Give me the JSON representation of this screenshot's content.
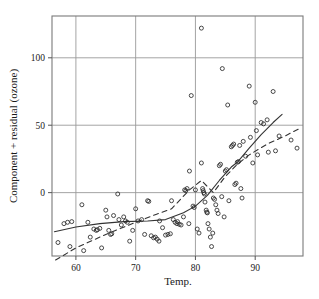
{
  "chart_data": {
    "type": "scatter",
    "title": "",
    "xlabel": "Temp.",
    "ylabel": "Component + residual (ozone)",
    "xlim": [
      56.0,
      98.0
    ],
    "ylim": [
      -47.0,
      131.0
    ],
    "xticks": [
      60,
      70,
      80,
      90
    ],
    "xticklabels": [
      "60",
      "70",
      "80",
      "90"
    ],
    "yticks": [
      0,
      50,
      100
    ],
    "yticklabels": [
      "0",
      "50",
      "100"
    ],
    "grid": true,
    "grid_color": "#9a9a9a",
    "frame_color": "#7a7a7a",
    "marker": "open-circle",
    "marker_color": "#2b2b2b",
    "marker_radius": 2.0,
    "legend": "none",
    "points": [
      [
        57.0,
        -37.0
      ],
      [
        58.0,
        -23.0
      ],
      [
        58.6,
        -22.0
      ],
      [
        59.3,
        -21.5
      ],
      [
        59.0,
        -40.0
      ],
      [
        61.0,
        -9.0
      ],
      [
        61.3,
        -43.0
      ],
      [
        62.0,
        -22.0
      ],
      [
        62.4,
        -33.0
      ],
      [
        63.0,
        -27.0
      ],
      [
        63.4,
        -28.0
      ],
      [
        63.6,
        -27.5
      ],
      [
        64.0,
        -26.5
      ],
      [
        64.3,
        -41.0
      ],
      [
        65.0,
        -13.0
      ],
      [
        65.2,
        -18.0
      ],
      [
        65.5,
        -28.0
      ],
      [
        65.8,
        -31.0
      ],
      [
        66.0,
        -30.5
      ],
      [
        66.3,
        -17.0
      ],
      [
        67.0,
        -1.0
      ],
      [
        67.2,
        -20.0
      ],
      [
        67.6,
        -24.0
      ],
      [
        68.0,
        -18.0
      ],
      [
        68.3,
        -21.0
      ],
      [
        68.6,
        -22.0
      ],
      [
        69.0,
        -36.0
      ],
      [
        69.5,
        -28.0
      ],
      [
        70.0,
        -12.0
      ],
      [
        70.4,
        -21.0
      ],
      [
        71.0,
        -20.0
      ],
      [
        71.5,
        -31.0
      ],
      [
        72.0,
        -6.0
      ],
      [
        72.2,
        -6.5
      ],
      [
        72.6,
        -32.0
      ],
      [
        73.0,
        -33.5
      ],
      [
        73.3,
        -33.0
      ],
      [
        73.6,
        -34.5
      ],
      [
        73.9,
        -36.0
      ],
      [
        74.0,
        -21.0
      ],
      [
        74.5,
        -26.0
      ],
      [
        75.0,
        -31.5
      ],
      [
        75.4,
        -31.0
      ],
      [
        75.8,
        -30.5
      ],
      [
        76.0,
        -6.0
      ],
      [
        76.3,
        -20.0
      ],
      [
        76.6,
        -22.0
      ],
      [
        76.9,
        -23.0
      ],
      [
        77.0,
        -21.5
      ],
      [
        77.3,
        -23.5
      ],
      [
        77.6,
        -24.0
      ],
      [
        78.0,
        -18.0
      ],
      [
        78.2,
        2.0
      ],
      [
        78.4,
        1.5
      ],
      [
        78.6,
        3.0
      ],
      [
        78.9,
        -23.0
      ],
      [
        79.0,
        16.0
      ],
      [
        79.3,
        72.0
      ],
      [
        79.6,
        -10.0
      ],
      [
        79.8,
        -11.0
      ],
      [
        80.0,
        2.0
      ],
      [
        80.3,
        -27.0
      ],
      [
        80.6,
        -30.0
      ],
      [
        81.0,
        122.0
      ],
      [
        81.0,
        22.0
      ],
      [
        81.2,
        3.0
      ],
      [
        81.3,
        1.5
      ],
      [
        81.4,
        0.0
      ],
      [
        81.5,
        -1.0
      ],
      [
        81.6,
        -7.0
      ],
      [
        81.8,
        -13.0
      ],
      [
        81.9,
        -14.5
      ],
      [
        82.0,
        -15.0
      ],
      [
        82.1,
        -23.0
      ],
      [
        82.3,
        -27.0
      ],
      [
        82.5,
        -33.0
      ],
      [
        82.7,
        -40.0
      ],
      [
        82.9,
        -30.0
      ],
      [
        83.0,
        -4.0
      ],
      [
        83.2,
        -5.0
      ],
      [
        83.4,
        -9.0
      ],
      [
        83.6,
        -13.0
      ],
      [
        83.8,
        -15.5
      ],
      [
        84.0,
        20.0
      ],
      [
        84.2,
        21.0
      ],
      [
        84.4,
        -3.0
      ],
      [
        84.5,
        92.0
      ],
      [
        84.8,
        -18.0
      ],
      [
        85.0,
        16.0
      ],
      [
        85.2,
        17.0
      ],
      [
        85.4,
        65.0
      ],
      [
        85.6,
        -6.0
      ],
      [
        86.0,
        34.0
      ],
      [
        86.2,
        35.0
      ],
      [
        86.4,
        36.0
      ],
      [
        86.6,
        6.0
      ],
      [
        86.8,
        7.0
      ],
      [
        87.0,
        22.5
      ],
      [
        87.2,
        23.0
      ],
      [
        87.4,
        35.0
      ],
      [
        87.6,
        3.0
      ],
      [
        87.8,
        -4.0
      ],
      [
        88.0,
        38.0
      ],
      [
        88.4,
        27.0
      ],
      [
        89.0,
        79.0
      ],
      [
        89.2,
        41.0
      ],
      [
        89.6,
        22.0
      ],
      [
        90.0,
        67.0
      ],
      [
        90.2,
        46.0
      ],
      [
        90.4,
        28.0
      ],
      [
        91.0,
        52.0
      ],
      [
        91.4,
        51.0
      ],
      [
        92.0,
        54.0
      ],
      [
        92.2,
        30.0
      ],
      [
        93.0,
        75.0
      ],
      [
        93.4,
        31.0
      ],
      [
        94.0,
        42.0
      ],
      [
        96.0,
        39.0
      ],
      [
        97.0,
        33.0
      ]
    ],
    "fits": [
      {
        "name": "loess-smooth",
        "style": "solid",
        "color": "#333333",
        "points": [
          [
            56.4,
            -29.0
          ],
          [
            60.0,
            -25.5
          ],
          [
            64.0,
            -23.0
          ],
          [
            68.0,
            -21.5
          ],
          [
            72.0,
            -21.0
          ],
          [
            75.0,
            -20.0
          ],
          [
            78.0,
            -15.0
          ],
          [
            80.0,
            -10.0
          ],
          [
            82.0,
            -2.0
          ],
          [
            84.0,
            9.0
          ],
          [
            86.0,
            19.0
          ],
          [
            87.0,
            22.5
          ],
          [
            89.0,
            33.0
          ],
          [
            91.0,
            43.0
          ],
          [
            93.0,
            52.0
          ],
          [
            94.5,
            58.0
          ]
        ]
      },
      {
        "name": "linear-component",
        "style": "dashed",
        "color": "#333333",
        "points": [
          [
            56.6,
            -50.0
          ],
          [
            60.0,
            -41.0
          ],
          [
            65.0,
            -31.0
          ],
          [
            70.0,
            -22.0
          ],
          [
            73.5,
            -16.0
          ],
          [
            76.0,
            -12.0
          ],
          [
            79.0,
            2.0
          ],
          [
            81.0,
            9.0
          ],
          [
            83.0,
            0.0
          ],
          [
            85.0,
            12.0
          ],
          [
            87.0,
            21.0
          ],
          [
            89.0,
            28.0
          ],
          [
            92.0,
            36.0
          ],
          [
            95.0,
            42.0
          ],
          [
            97.6,
            48.0
          ]
        ]
      }
    ]
  }
}
